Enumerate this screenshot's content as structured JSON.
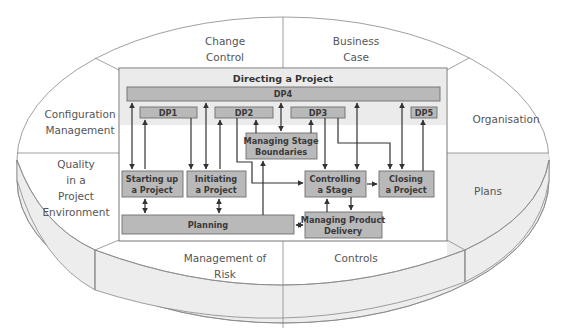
{
  "diagram": {
    "title": "Directing a Project",
    "colors": {
      "box_fill": "#b9b9b9",
      "box_stroke": "#6f6f6f",
      "header_band": "#ebebeb",
      "rim_fill": "#ededed",
      "plans_fill": "#ececec",
      "arrow": "#333333",
      "segment_text": "#555555"
    },
    "outer_segments": [
      {
        "id": "change-control",
        "lines": [
          "Change",
          "Control"
        ]
      },
      {
        "id": "business-case",
        "lines": [
          "Business",
          "Case"
        ]
      },
      {
        "id": "organisation",
        "lines": [
          "Organisation"
        ]
      },
      {
        "id": "plans",
        "lines": [
          "Plans"
        ]
      },
      {
        "id": "controls",
        "lines": [
          "Controls"
        ]
      },
      {
        "id": "management-of-risk",
        "lines": [
          "Management of",
          "Risk"
        ]
      },
      {
        "id": "quality",
        "lines": [
          "Quality",
          "in a",
          "Project",
          "Environment"
        ]
      },
      {
        "id": "configuration-management",
        "lines": [
          "Configuration",
          "Management"
        ]
      }
    ],
    "directing_subprocesses": {
      "dp4": "DP4",
      "dp1": "DP1",
      "dp2": "DP2",
      "dp3": "DP3",
      "dp5": "DP5"
    },
    "processes": {
      "managing_stage_boundaries": [
        "Managing Stage",
        "Boundaries"
      ],
      "starting_up": [
        "Starting up",
        "a Project"
      ],
      "initiating": [
        "Initiating",
        "a Project"
      ],
      "controlling": [
        "Controlling",
        "a Stage"
      ],
      "closing": [
        "Closing",
        "a Project"
      ],
      "planning": [
        "Planning"
      ],
      "managing_product_delivery": [
        "Managing Product",
        "Delivery"
      ]
    }
  }
}
